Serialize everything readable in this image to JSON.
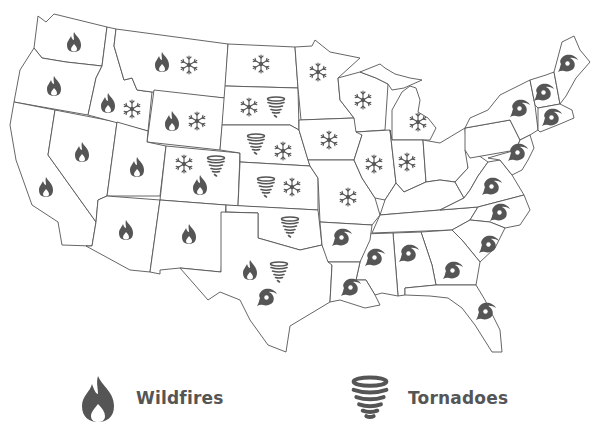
{
  "colors": {
    "icon": "#555555",
    "border": "#555555",
    "background": "#ffffff",
    "label": "#555555"
  },
  "legend": [
    {
      "icon": "fire-icon",
      "label": "Wildfires"
    },
    {
      "icon": "tornado-icon",
      "label": "Tornadoes"
    }
  ],
  "states": [
    {
      "name": "WA",
      "hazards": [
        "wildfire"
      ]
    },
    {
      "name": "OR",
      "hazards": [
        "wildfire"
      ]
    },
    {
      "name": "CA",
      "hazards": [
        "wildfire"
      ]
    },
    {
      "name": "NV",
      "hazards": [
        "wildfire"
      ]
    },
    {
      "name": "ID",
      "hazards": [
        "wildfire",
        "snow"
      ]
    },
    {
      "name": "MT",
      "hazards": [
        "wildfire",
        "snow"
      ]
    },
    {
      "name": "WY",
      "hazards": [
        "wildfire",
        "snow"
      ]
    },
    {
      "name": "UT",
      "hazards": [
        "wildfire"
      ]
    },
    {
      "name": "CO",
      "hazards": [
        "snow",
        "tornado",
        "wildfire"
      ]
    },
    {
      "name": "AZ",
      "hazards": [
        "wildfire"
      ]
    },
    {
      "name": "NM",
      "hazards": [
        "wildfire"
      ]
    },
    {
      "name": "ND",
      "hazards": [
        "snow"
      ]
    },
    {
      "name": "SD",
      "hazards": [
        "snow",
        "tornado"
      ]
    },
    {
      "name": "NE",
      "hazards": [
        "tornado",
        "snow"
      ]
    },
    {
      "name": "KS",
      "hazards": [
        "tornado",
        "snow"
      ]
    },
    {
      "name": "OK",
      "hazards": [
        "tornado"
      ]
    },
    {
      "name": "TX",
      "hazards": [
        "wildfire",
        "tornado",
        "hurricane"
      ]
    },
    {
      "name": "MN",
      "hazards": [
        "snow"
      ]
    },
    {
      "name": "WI",
      "hazards": [
        "snow"
      ]
    },
    {
      "name": "MI",
      "hazards": [
        "snow"
      ]
    },
    {
      "name": "IA",
      "hazards": [
        "snow"
      ]
    },
    {
      "name": "IL",
      "hazards": [
        "snow"
      ]
    },
    {
      "name": "IN",
      "hazards": [
        "snow"
      ]
    },
    {
      "name": "MO",
      "hazards": [
        "snow"
      ]
    },
    {
      "name": "AR",
      "hazards": [
        "hurricane"
      ]
    },
    {
      "name": "LA",
      "hazards": [
        "hurricane"
      ]
    },
    {
      "name": "MS",
      "hazards": [
        "hurricane"
      ]
    },
    {
      "name": "AL",
      "hazards": [
        "hurricane"
      ]
    },
    {
      "name": "GA",
      "hazards": [
        "hurricane"
      ]
    },
    {
      "name": "FL",
      "hazards": [
        "hurricane"
      ]
    },
    {
      "name": "SC",
      "hazards": [
        "hurricane"
      ]
    },
    {
      "name": "NC",
      "hazards": [
        "hurricane"
      ]
    },
    {
      "name": "VA",
      "hazards": [
        "hurricane"
      ]
    },
    {
      "name": "MD-DE",
      "hazards": [
        "hurricane"
      ]
    },
    {
      "name": "NY",
      "hazards": [
        "hurricane"
      ]
    },
    {
      "name": "VT-NH",
      "hazards": [
        "hurricane"
      ]
    },
    {
      "name": "MA",
      "hazards": [
        "hurricane"
      ]
    },
    {
      "name": "ME",
      "hazards": [
        "hurricane"
      ]
    }
  ]
}
